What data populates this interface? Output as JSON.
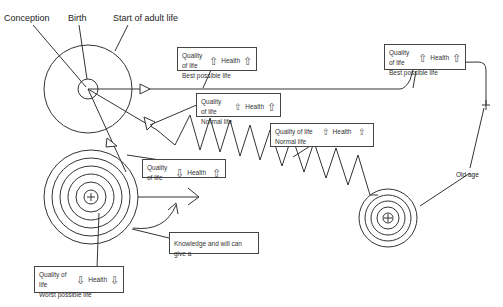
{
  "labels": {
    "conception": "Conception",
    "birth": "Birth",
    "adult": "Start of adult life",
    "old_age": "Old age"
  },
  "boxes": {
    "best1": {
      "quality": "Quality of life",
      "quality_arrow": "⇧",
      "health": "Health",
      "health_arrow": "⇧",
      "desc": "Best possible life"
    },
    "best2": {
      "quality": "Quality of life",
      "quality_arrow": "⇧",
      "health": "Health",
      "health_arrow": "⇧",
      "desc": "Best possible life"
    },
    "normal1": {
      "quality": "Quality of life",
      "quality_arrow": "⇧",
      "health": "Health",
      "health_arrow": "⇧",
      "desc": "Normal life"
    },
    "normal2": {
      "quality": "Quality of life",
      "quality_arrow": "⇧",
      "health": "Health",
      "health_arrow": "⇧",
      "desc": "Normal life"
    },
    "mixed": {
      "quality": "Quality of life",
      "quality_arrow": "⇩",
      "health": "Health",
      "health_arrow": "⇧"
    },
    "worst": {
      "quality": "Quality of life",
      "quality_arrow": "⇩",
      "health": "Health",
      "health_arrow": "⇩",
      "desc": "Worst possible life"
    },
    "knowledge": {
      "text": "Knowledge and will can give a"
    }
  },
  "colors": {
    "line": "#333333",
    "box_border": "#444444",
    "text": "#222222"
  }
}
